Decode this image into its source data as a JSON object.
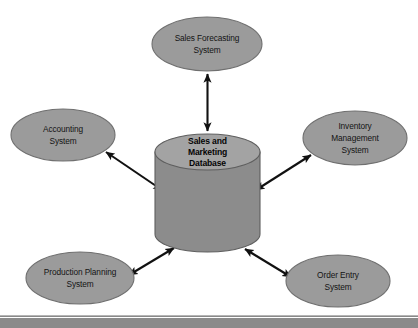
{
  "diagram": {
    "type": "hub-and-spoke",
    "background_color": "#ffffff",
    "ellipse_fill": "#9b9b9b",
    "ellipse_stroke": "#6f6f6f",
    "cylinder_top_fill": "#a3a3a3",
    "cylinder_body_fill": "#8c8c8c",
    "cylinder_stroke": "#5e5e5e",
    "arrow_color": "#111111",
    "footer_band_color": "#8a8a8a",
    "center": {
      "name": "sales-marketing-database",
      "lines": [
        "Sales and",
        "Marketing",
        "Database"
      ],
      "shape": "cylinder",
      "bold": true
    },
    "nodes": [
      {
        "name": "sales-forecasting-system",
        "lines": [
          "Sales Forecasting",
          "System"
        ],
        "position": "top",
        "cx": 207,
        "cy": 44,
        "rx": 55,
        "ry": 27
      },
      {
        "name": "accounting-system",
        "lines": [
          "Accounting",
          "System"
        ],
        "position": "left-upper",
        "cx": 63,
        "cy": 135,
        "rx": 52,
        "ry": 26
      },
      {
        "name": "inventory-management-system",
        "lines": [
          "Inventory",
          "Management",
          "System"
        ],
        "position": "right-upper",
        "cx": 355,
        "cy": 138,
        "rx": 52,
        "ry": 27
      },
      {
        "name": "production-planning-system",
        "lines": [
          "Production Planning",
          "System"
        ],
        "position": "left-lower",
        "cx": 80,
        "cy": 278,
        "rx": 54,
        "ry": 26
      },
      {
        "name": "order-entry-system",
        "lines": [
          "Order Entry",
          "System"
        ],
        "position": "right-lower",
        "cx": 338,
        "cy": 281,
        "rx": 52,
        "ry": 26
      }
    ],
    "connections": [
      {
        "name": "link-forecasting-to-database",
        "from": "sales-forecasting-system",
        "to": "sales-marketing-database",
        "style": "double-headed-arrow"
      },
      {
        "name": "link-accounting-to-database",
        "from": "accounting-system",
        "to": "sales-marketing-database",
        "style": "double-headed-arrow"
      },
      {
        "name": "link-inventory-to-database",
        "from": "inventory-management-system",
        "to": "sales-marketing-database",
        "style": "double-headed-arrow"
      },
      {
        "name": "link-production-to-database",
        "from": "production-planning-system",
        "to": "sales-marketing-database",
        "style": "double-headed-arrow"
      },
      {
        "name": "link-order-entry-to-database",
        "from": "order-entry-system",
        "to": "sales-marketing-database",
        "style": "double-headed-arrow"
      }
    ]
  }
}
